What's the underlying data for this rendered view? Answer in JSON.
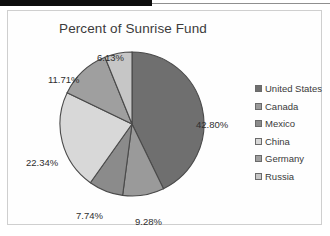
{
  "chart": {
    "title": "Percent of Sunrise Fund"
  },
  "chart_data": {
    "type": "pie",
    "title": "Percent of Sunrise Fund",
    "categories": [
      "United States",
      "Canada",
      "Mexico",
      "China",
      "Germany",
      "Russia"
    ],
    "values": [
      42.8,
      9.28,
      7.74,
      22.34,
      11.71,
      6.13
    ],
    "labels": [
      "42.80%",
      "9.28%",
      "7.74%",
      "22.34%",
      "11.71%",
      "6.13%"
    ],
    "colors": [
      "#6f6f6f",
      "#9a9a9a",
      "#8b8b8b",
      "#d8d8d8",
      "#9f9f9f",
      "#c6c6c6"
    ],
    "units": "percent",
    "legend_position": "right",
    "grid": false,
    "start_angle_deg": 0,
    "direction": "clockwise",
    "slice_outline_color": "#4a4a4a"
  },
  "legend": {
    "items": [
      {
        "label": "United States",
        "color": "#6f6f6f"
      },
      {
        "label": "Canada",
        "color": "#9a9a9a"
      },
      {
        "label": "Mexico",
        "color": "#8b8b8b"
      },
      {
        "label": "China",
        "color": "#d8d8d8"
      },
      {
        "label": "Germany",
        "color": "#9f9f9f"
      },
      {
        "label": "Russia",
        "color": "#c6c6c6"
      }
    ]
  },
  "slice_labels": [
    {
      "text": "42.80%",
      "left": 188,
      "top": 108
    },
    {
      "text": "9.28%",
      "left": 127,
      "top": 205
    },
    {
      "text": "7.74%",
      "left": 68,
      "top": 199
    },
    {
      "text": "22.34%",
      "left": 18,
      "top": 146
    },
    {
      "text": "11.71%",
      "left": 40,
      "top": 63
    },
    {
      "text": "6.13%",
      "left": 89,
      "top": 41
    }
  ]
}
